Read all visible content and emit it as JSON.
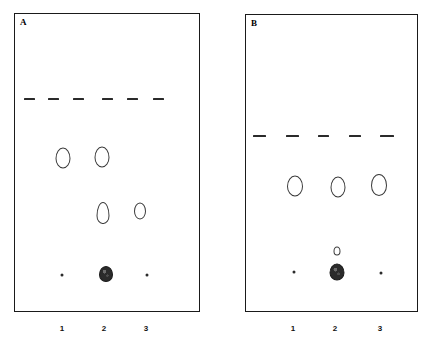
{
  "figure": {
    "background_color": "#ffffff",
    "line_color": "#1a1a1a",
    "spot_outline_color": "#3a3a3a",
    "spot_fill_color": "#2b2b2b",
    "width": 430,
    "height": 346
  },
  "panels": [
    {
      "id": "A",
      "letter": "A",
      "frame": {
        "x": 14,
        "y": 13,
        "w": 186,
        "h": 299
      },
      "solvent_front": {
        "label": "solvent front",
        "y": 97,
        "dash_count": 6,
        "dashes": [
          {
            "x": 23,
            "w": 11
          },
          {
            "x": 47,
            "w": 11
          },
          {
            "x": 72,
            "w": 11
          },
          {
            "x": 101,
            "w": 11
          },
          {
            "x": 126,
            "w": 11
          },
          {
            "x": 152,
            "w": 11
          }
        ]
      },
      "lanes": [
        {
          "label": "1",
          "x": 62
        },
        {
          "label": "2",
          "x": 104
        },
        {
          "label": "3",
          "x": 146
        }
      ],
      "lane_label_y": 322,
      "spots": [
        {
          "lane": "1",
          "x": 62,
          "y": 157,
          "w": 15,
          "h": 21,
          "shape": "oval",
          "style": "ring",
          "name": "spot-a-lane1-upper"
        },
        {
          "lane": "2",
          "x": 101,
          "y": 156,
          "w": 15,
          "h": 21,
          "shape": "oval",
          "style": "ring",
          "name": "spot-a-lane2-upper"
        },
        {
          "lane": "2",
          "x": 102,
          "y": 212,
          "w": 13,
          "h": 22,
          "shape": "teardrop",
          "style": "ring",
          "name": "spot-a-lane2-middle"
        },
        {
          "lane": "3",
          "x": 139,
          "y": 210,
          "w": 12,
          "h": 17,
          "shape": "oval",
          "style": "ring",
          "name": "spot-a-lane3-middle"
        },
        {
          "lane": "1",
          "x": 61,
          "y": 274,
          "w": 3,
          "h": 3,
          "shape": "dot",
          "style": "dot",
          "name": "spot-a-lane1-origin"
        },
        {
          "lane": "2",
          "x": 105,
          "y": 273,
          "w": 14,
          "h": 16,
          "shape": "oval",
          "style": "filled",
          "name": "spot-a-lane2-origin"
        },
        {
          "lane": "3",
          "x": 146,
          "y": 274,
          "w": 3,
          "h": 3,
          "shape": "dot",
          "style": "dot",
          "name": "spot-a-lane3-origin"
        }
      ]
    },
    {
      "id": "B",
      "letter": "B",
      "frame": {
        "x": 245,
        "y": 14,
        "w": 173,
        "h": 298
      },
      "solvent_front": {
        "label": "solvent front",
        "y": 134,
        "dash_count": 5,
        "dashes": [
          {
            "x": 252,
            "w": 13
          },
          {
            "x": 285,
            "w": 13
          },
          {
            "x": 317,
            "w": 11
          },
          {
            "x": 348,
            "w": 12
          },
          {
            "x": 379,
            "w": 14
          }
        ]
      },
      "lanes": [
        {
          "label": "1",
          "x": 293
        },
        {
          "label": "2",
          "x": 335
        },
        {
          "label": "3",
          "x": 380
        }
      ],
      "lane_label_y": 322,
      "spots": [
        {
          "lane": "1",
          "x": 294,
          "y": 185,
          "w": 16,
          "h": 21,
          "shape": "oval",
          "style": "ring",
          "name": "spot-b-lane1-upper"
        },
        {
          "lane": "2",
          "x": 337,
          "y": 186,
          "w": 15,
          "h": 21,
          "shape": "oval",
          "style": "ring",
          "name": "spot-b-lane2-upper"
        },
        {
          "lane": "3",
          "x": 378,
          "y": 184,
          "w": 16,
          "h": 22,
          "shape": "oval",
          "style": "ring",
          "name": "spot-b-lane3-upper"
        },
        {
          "lane": "2",
          "x": 336,
          "y": 250,
          "w": 7,
          "h": 9,
          "shape": "oval",
          "style": "ring",
          "name": "spot-b-lane2-minor"
        },
        {
          "lane": "1",
          "x": 293,
          "y": 271,
          "w": 3,
          "h": 3,
          "shape": "dot",
          "style": "dot",
          "name": "spot-b-lane1-origin"
        },
        {
          "lane": "2",
          "x": 336,
          "y": 271,
          "w": 15,
          "h": 17,
          "shape": "oval",
          "style": "filled",
          "name": "spot-b-lane2-origin"
        },
        {
          "lane": "3",
          "x": 380,
          "y": 272,
          "w": 3,
          "h": 3,
          "shape": "dot",
          "style": "dot",
          "name": "spot-b-lane3-origin"
        }
      ]
    }
  ]
}
